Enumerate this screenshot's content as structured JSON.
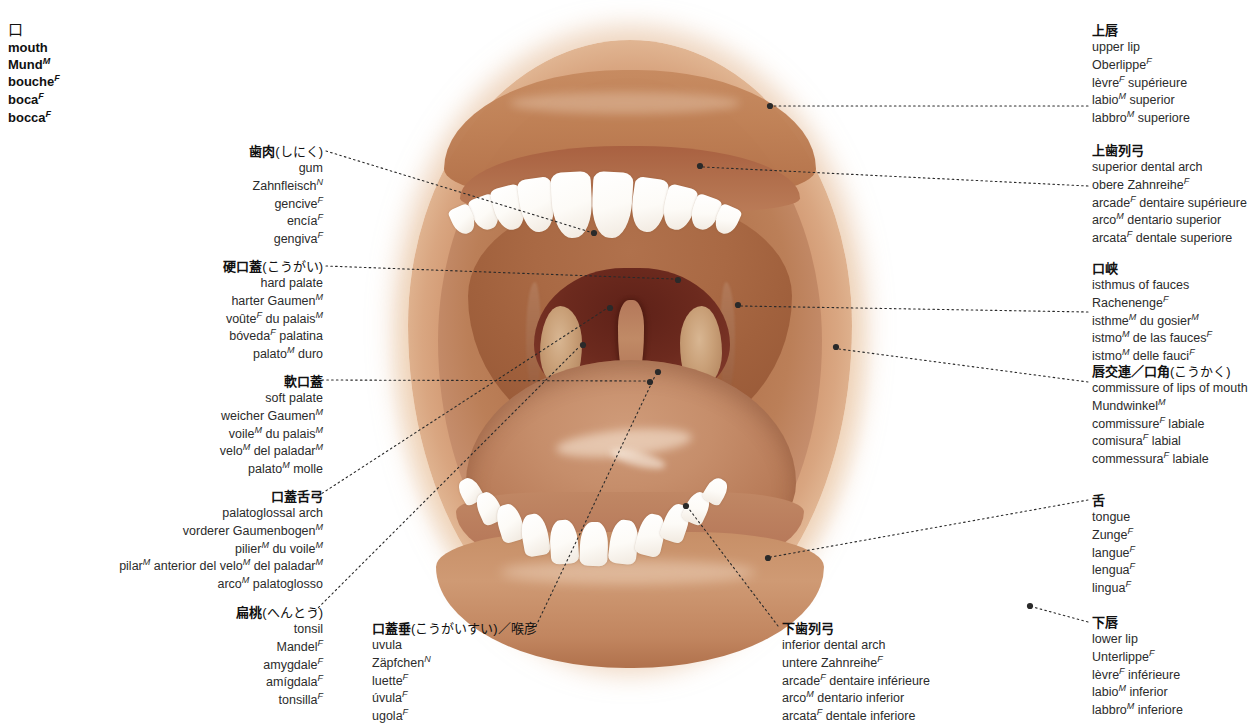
{
  "title_block": {
    "glyph": "口",
    "terms": [
      {
        "text": "mouth",
        "gender": ""
      },
      {
        "text": "Mund",
        "gender": "M"
      },
      {
        "text": "bouche",
        "gender": "F"
      },
      {
        "text": "boca",
        "gender": "F"
      },
      {
        "text": "bocca",
        "gender": "F"
      }
    ]
  },
  "colors": {
    "lip": "#c98a5e",
    "oral_mucosa": "#b0714a",
    "fauces_dark": "#5e2118",
    "tooth": "#ffffff",
    "leader_line": "#2a2a2a",
    "text": "#1a1a1a"
  },
  "labels": [
    {
      "id": "gum",
      "side": "left",
      "kanji": "歯肉",
      "kana": "(しにく)",
      "terms": [
        {
          "text": "gum",
          "gender": ""
        },
        {
          "text": "Zahnfleisch",
          "gender": "N"
        },
        {
          "text": "gencive",
          "gender": "F"
        },
        {
          "text": "encía",
          "gender": "F"
        },
        {
          "text": "gengiva",
          "gender": "F"
        }
      ]
    },
    {
      "id": "hard-palate",
      "side": "left",
      "kanji": "硬口蓋",
      "kana": "(こうがい)",
      "terms": [
        {
          "text": "hard palate",
          "gender": ""
        },
        {
          "text": "harter Gaumen",
          "gender": "M"
        },
        {
          "text": "voûte<sup>F</sup> du palais",
          "gender": "M",
          "html": true
        },
        {
          "text": "bóveda<sup>F</sup> palatina",
          "gender": "",
          "html": true
        },
        {
          "text": "palato<sup>M</sup> duro",
          "gender": "",
          "html": true
        }
      ]
    },
    {
      "id": "soft-palate",
      "side": "left",
      "kanji": "軟口蓋",
      "kana": "",
      "terms": [
        {
          "text": "soft palate",
          "gender": ""
        },
        {
          "text": "weicher Gaumen",
          "gender": "M"
        },
        {
          "text": "voile<sup>M</sup> du palais",
          "gender": "M",
          "html": true
        },
        {
          "text": "velo<sup>M</sup> del paladar",
          "gender": "M",
          "html": true
        },
        {
          "text": "palato<sup>M</sup> molle",
          "gender": "",
          "html": true
        }
      ]
    },
    {
      "id": "palatoglossal-arch",
      "side": "left",
      "kanji": "口蓋舌弓",
      "kana": "",
      "terms": [
        {
          "text": "palatoglossal arch",
          "gender": ""
        },
        {
          "text": "vorderer Gaumenbogen",
          "gender": "M"
        },
        {
          "text": "pilier<sup>M</sup> du voile",
          "gender": "M",
          "html": true
        },
        {
          "text": "pilar<sup>M</sup> anterior del velo<sup>M</sup> del paladar",
          "gender": "M",
          "html": true
        },
        {
          "text": "arco<sup>M</sup> palatoglosso",
          "gender": "",
          "html": true
        }
      ]
    },
    {
      "id": "tonsil",
      "side": "left",
      "kanji": "扁桃",
      "kana": "(へんとう)",
      "terms": [
        {
          "text": "tonsil",
          "gender": ""
        },
        {
          "text": "Mandel",
          "gender": "F"
        },
        {
          "text": "amygdale",
          "gender": "F"
        },
        {
          "text": "amígdala",
          "gender": "F"
        },
        {
          "text": "tonsilla",
          "gender": "F"
        }
      ]
    },
    {
      "id": "uvula",
      "side": "center",
      "kanji": "口蓋垂",
      "kana": "(こうがいすい)／喉彦",
      "terms": [
        {
          "text": "uvula",
          "gender": ""
        },
        {
          "text": "Zäpfchen",
          "gender": "N"
        },
        {
          "text": "luette",
          "gender": "F"
        },
        {
          "text": "úvula",
          "gender": "F"
        },
        {
          "text": "ugola",
          "gender": "F"
        }
      ]
    },
    {
      "id": "inferior-dental-arch",
      "side": "center",
      "kanji": "下歯列弓",
      "kana": "",
      "terms": [
        {
          "text": "inferior dental arch",
          "gender": ""
        },
        {
          "text": "untere Zahnreihe",
          "gender": "F"
        },
        {
          "text": "arcade<sup>F</sup> dentaire inférieure",
          "gender": "",
          "html": true
        },
        {
          "text": "arco<sup>M</sup> dentario inferior",
          "gender": "",
          "html": true
        },
        {
          "text": "arcata<sup>F</sup> dentale inferiore",
          "gender": "",
          "html": true
        }
      ]
    },
    {
      "id": "upper-lip",
      "side": "right",
      "kanji": "上唇",
      "kana": "",
      "terms": [
        {
          "text": "upper lip",
          "gender": ""
        },
        {
          "text": "Oberlippe",
          "gender": "F"
        },
        {
          "text": "lèvre<sup>F</sup> supérieure",
          "gender": "",
          "html": true
        },
        {
          "text": "labio<sup>M</sup> superior",
          "gender": "",
          "html": true
        },
        {
          "text": "labbro<sup>M</sup> superiore",
          "gender": "",
          "html": true
        }
      ]
    },
    {
      "id": "superior-dental-arch",
      "side": "right",
      "kanji": "上歯列弓",
      "kana": "",
      "terms": [
        {
          "text": "superior dental arch",
          "gender": ""
        },
        {
          "text": "obere Zahnreihe",
          "gender": "F"
        },
        {
          "text": "arcade<sup>F</sup> dentaire supérieure",
          "gender": "",
          "html": true
        },
        {
          "text": "arco<sup>M</sup> dentario superior",
          "gender": "",
          "html": true
        },
        {
          "text": "arcata<sup>F</sup> dentale superiore",
          "gender": "",
          "html": true
        }
      ]
    },
    {
      "id": "isthmus-of-fauces",
      "side": "right",
      "kanji": "口峡",
      "kana": "",
      "terms": [
        {
          "text": "isthmus of fauces",
          "gender": ""
        },
        {
          "text": "Rachenenge",
          "gender": "F"
        },
        {
          "text": "isthme<sup>M</sup> du gosier",
          "gender": "M",
          "html": true
        },
        {
          "text": "istmo<sup>M</sup> de las fauces",
          "gender": "F",
          "html": true
        },
        {
          "text": "istmo<sup>M</sup> delle fauci",
          "gender": "F",
          "html": true
        }
      ]
    },
    {
      "id": "commissure-of-lips",
      "side": "right",
      "kanji": "唇交連／口角",
      "kana": "(こうかく)",
      "terms": [
        {
          "text": "commissure of lips of mouth",
          "gender": ""
        },
        {
          "text": "Mundwinkel",
          "gender": "M"
        },
        {
          "text": "commissure<sup>F</sup> labiale",
          "gender": "",
          "html": true
        },
        {
          "text": "comisura<sup>F</sup> labial",
          "gender": "",
          "html": true
        },
        {
          "text": "commessura<sup>F</sup> labiale",
          "gender": "",
          "html": true
        }
      ]
    },
    {
      "id": "tongue",
      "side": "right",
      "kanji": "舌",
      "kana": "",
      "terms": [
        {
          "text": "tongue",
          "gender": ""
        },
        {
          "text": "Zunge",
          "gender": "F"
        },
        {
          "text": "langue",
          "gender": "F"
        },
        {
          "text": "lengua",
          "gender": "F"
        },
        {
          "text": "lingua",
          "gender": "F"
        }
      ]
    },
    {
      "id": "lower-lip",
      "side": "right",
      "kanji": "下唇",
      "kana": "",
      "terms": [
        {
          "text": "lower lip",
          "gender": ""
        },
        {
          "text": "Unterlippe",
          "gender": "F"
        },
        {
          "text": "lèvre<sup>F</sup> inférieure",
          "gender": "",
          "html": true
        },
        {
          "text": "labio<sup>M</sup> inferior",
          "gender": "",
          "html": true
        },
        {
          "text": "labbro<sup>M</sup> inferiore",
          "gender": "",
          "html": true
        }
      ]
    }
  ]
}
